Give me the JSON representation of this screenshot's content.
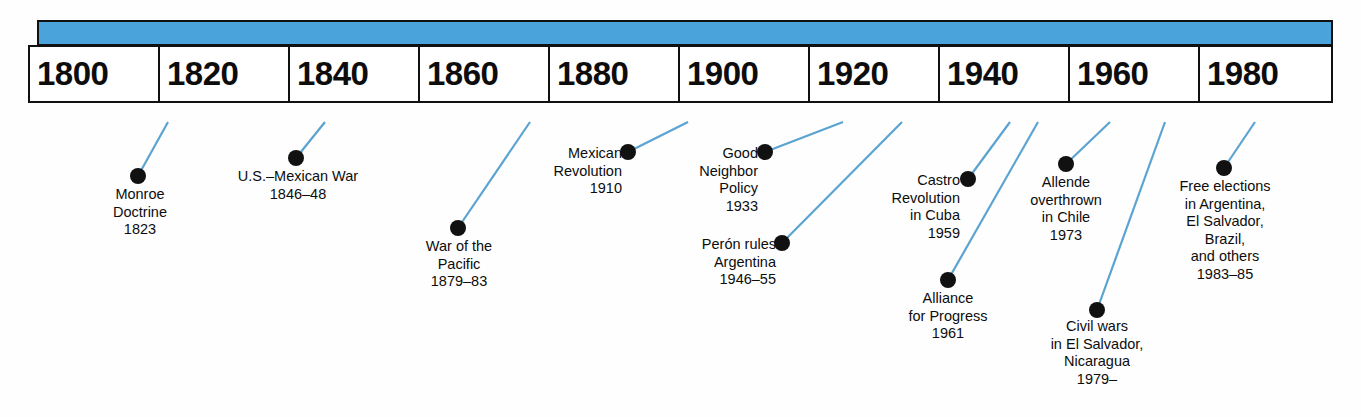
{
  "timeline": {
    "title": "Latin America timeline",
    "accent_color": "#4ba3db",
    "line_color": "#5ba3d0",
    "dot_color": "#111111",
    "axis_years": [
      "1800",
      "1820",
      "1840",
      "1860",
      "1880",
      "1900",
      "1920",
      "1940",
      "1960",
      "1980"
    ],
    "events": [
      {
        "name": "monroe-doctrine",
        "lines": [
          "Monroe",
          "Doctrine",
          "1823"
        ],
        "text": "Monroe\nDoctrine\n1823",
        "year": "1823",
        "dot": {
          "x": 138,
          "y": 176
        },
        "anchor": {
          "x": 168,
          "y": 122
        },
        "label": {
          "x": 90,
          "y": 186,
          "width": 100
        }
      },
      {
        "name": "us-mexican-war",
        "lines": [
          "U.S.–Mexican War",
          "1846–48"
        ],
        "text": "U.S.–Mexican War\n1846–48",
        "year": "1846–48",
        "dot": {
          "x": 296,
          "y": 158
        },
        "anchor": {
          "x": 325,
          "y": 122
        },
        "label": {
          "x": 208,
          "y": 168,
          "width": 180
        }
      },
      {
        "name": "war-of-the-pacific",
        "lines": [
          "War of the",
          "Pacific",
          "1879–83"
        ],
        "text": "War of the\nPacific\n1879–83",
        "year": "1879–83",
        "dot": {
          "x": 458,
          "y": 228
        },
        "anchor": {
          "x": 530,
          "y": 122
        },
        "label": {
          "x": 400,
          "y": 238,
          "width": 118
        }
      },
      {
        "name": "mexican-revolution",
        "lines": [
          "Mexican",
          "Revolution",
          "1910"
        ],
        "text": "Mexican\nRevolution\n1910",
        "year": "1910",
        "dot": {
          "x": 628,
          "y": 152
        },
        "anchor": {
          "x": 688,
          "y": 122
        },
        "label": {
          "x": 530,
          "y": 145,
          "width": 92,
          "align": "right"
        }
      },
      {
        "name": "good-neighbor-policy",
        "lines": [
          "Good",
          "Neighbor",
          "Policy",
          "1933"
        ],
        "text": "Good\nNeighbor\nPolicy\n1933",
        "year": "1933",
        "dot": {
          "x": 765,
          "y": 152
        },
        "anchor": {
          "x": 843,
          "y": 122
        },
        "label": {
          "x": 666,
          "y": 145,
          "width": 92,
          "align": "right"
        }
      },
      {
        "name": "peron-rules-argentina",
        "lines": [
          "Perón rules",
          "Argentina",
          "1946–55"
        ],
        "text": "Perón rules\nArgentina\n1946–55",
        "year": "1946–55",
        "dot": {
          "x": 782,
          "y": 243
        },
        "anchor": {
          "x": 902,
          "y": 122
        },
        "label": {
          "x": 666,
          "y": 236,
          "width": 110,
          "align": "right"
        }
      },
      {
        "name": "castro-revolution-cuba",
        "lines": [
          "Castro",
          "Revolution",
          "in Cuba",
          "1959"
        ],
        "text": "Castro\nRevolution\nin Cuba\n1959",
        "year": "1959",
        "dot": {
          "x": 968,
          "y": 179
        },
        "anchor": {
          "x": 1010,
          "y": 122
        },
        "label": {
          "x": 868,
          "y": 172,
          "width": 92,
          "align": "right"
        }
      },
      {
        "name": "alliance-for-progress",
        "lines": [
          "Alliance",
          "for Progress",
          "1961"
        ],
        "text": "Alliance\nfor Progress\n1961",
        "year": "1961",
        "dot": {
          "x": 948,
          "y": 280
        },
        "anchor": {
          "x": 1038,
          "y": 122
        },
        "label": {
          "x": 884,
          "y": 290,
          "width": 128
        }
      },
      {
        "name": "allende-overthrown-chile",
        "lines": [
          "Allende",
          "overthrown",
          "in Chile",
          "1973"
        ],
        "text": "Allende\noverthrown\nin Chile\n1973",
        "year": "1973",
        "dot": {
          "x": 1066,
          "y": 164
        },
        "anchor": {
          "x": 1110,
          "y": 122
        },
        "label": {
          "x": 1008,
          "y": 174,
          "width": 116
        }
      },
      {
        "name": "civil-wars-el-salvador-nicaragua",
        "lines": [
          "Civil wars",
          "in El Salvador,",
          "Nicaragua",
          "1979–"
        ],
        "text": "Civil wars\nin El Salvador,\nNicaragua\n1979–",
        "year": "1979–",
        "dot": {
          "x": 1097,
          "y": 310
        },
        "anchor": {
          "x": 1165,
          "y": 122
        },
        "label": {
          "x": 1030,
          "y": 318,
          "width": 134
        }
      },
      {
        "name": "free-elections",
        "lines": [
          "Free elections",
          "in Argentina,",
          "El Salvador,",
          "Brazil,",
          "and others",
          "1983–85"
        ],
        "text": "Free elections\nin Argentina,\nEl Salvador,\nBrazil,\nand others\n1983–85",
        "year": "1983–85",
        "dot": {
          "x": 1224,
          "y": 168
        },
        "anchor": {
          "x": 1255,
          "y": 122
        },
        "label": {
          "x": 1157,
          "y": 178,
          "width": 136
        }
      }
    ]
  }
}
